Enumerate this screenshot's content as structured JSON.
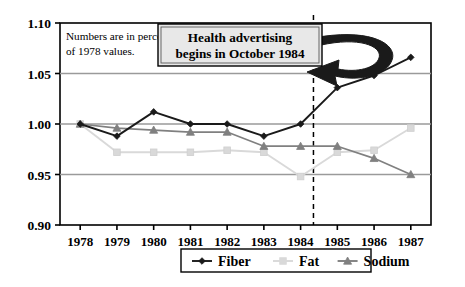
{
  "chart_data": {
    "type": "line",
    "title": "",
    "xlabel": "",
    "ylabel": "",
    "categories": [
      "1978",
      "1979",
      "1980",
      "1981",
      "1982",
      "1983",
      "1984",
      "1985",
      "1986",
      "1987"
    ],
    "x": [
      1978,
      1979,
      1980,
      1981,
      1982,
      1983,
      1984,
      1985,
      1986,
      1987
    ],
    "ylim": [
      0.9,
      1.1
    ],
    "yticks": [
      "0.90",
      "0.95",
      "1.00",
      "1.05",
      "1.10"
    ],
    "ytick_values": [
      0.9,
      0.95,
      1.0,
      1.05,
      1.1
    ],
    "grid": "horizontal",
    "legend_position": "bottom-center",
    "series": [
      {
        "name": "Fiber",
        "marker": "diamond",
        "color": "#1a1a1a",
        "values": [
          1.0,
          0.988,
          1.012,
          1.0,
          1.0,
          0.988,
          1.0,
          1.036,
          1.048,
          1.066
        ]
      },
      {
        "name": "Fat",
        "marker": "square",
        "color": "#d9d9d9",
        "values": [
          1.0,
          0.972,
          0.972,
          0.972,
          0.974,
          0.972,
          0.948,
          0.972,
          0.974,
          0.996
        ]
      },
      {
        "name": "Sodium",
        "marker": "triangle",
        "color": "#808080",
        "values": [
          1.0,
          0.996,
          0.994,
          0.992,
          0.992,
          0.978,
          0.978,
          0.978,
          0.966,
          0.95
        ]
      }
    ],
    "annotations": [
      {
        "name": "note",
        "line1": "Numbers are in percent",
        "line2": "of 1978 values."
      },
      {
        "name": "callout",
        "line1": "Health advertising",
        "line2": "begins in October 1984"
      },
      {
        "name": "event-line",
        "label": "October 1984",
        "x": 1984.35,
        "style": "dashed-vertical"
      }
    ]
  },
  "legend": {
    "items": [
      {
        "label": "Fiber",
        "marker": "diamond",
        "color": "#1a1a1a"
      },
      {
        "label": "Fat",
        "marker": "square",
        "color": "#d9d9d9"
      },
      {
        "label": "Sodium",
        "marker": "triangle",
        "color": "#808080"
      }
    ]
  },
  "colors": {
    "fiber": "#1a1a1a",
    "fat": "#d9d9d9",
    "sodium": "#808080",
    "axis": "#000000",
    "grid": "#9a9a9a",
    "callout_fill": "#e8e8e8",
    "background": "#ffffff"
  }
}
